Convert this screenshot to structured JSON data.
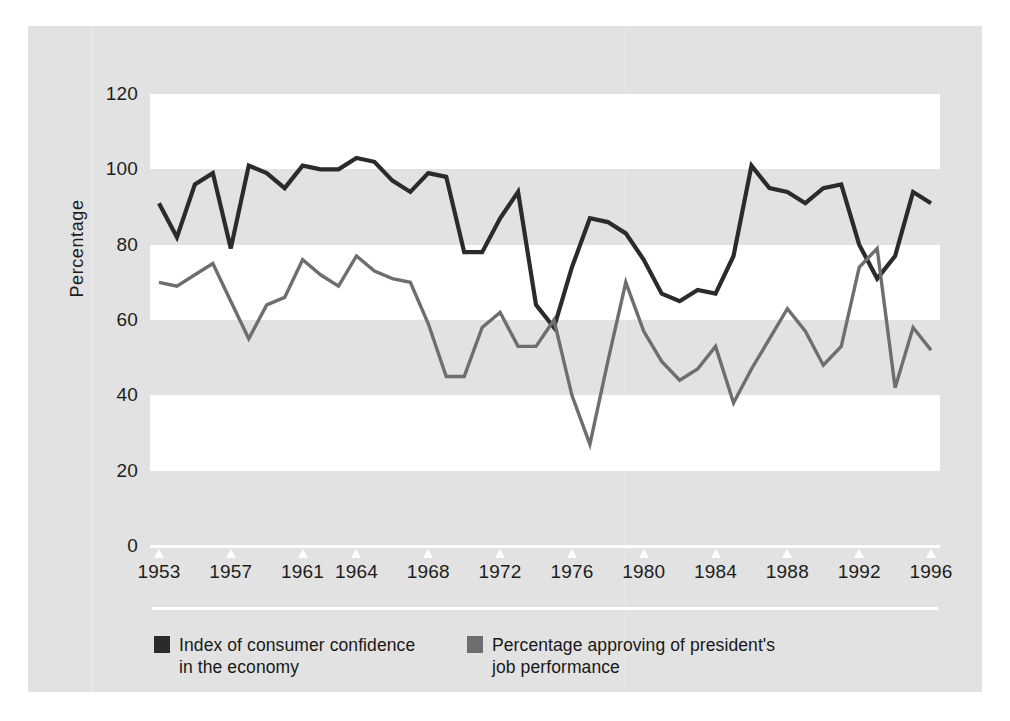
{
  "figure": {
    "background_color": "#e2e2e2",
    "plot_background_color": "#e2e2e2",
    "band_color": "#ffffff",
    "axis_color": "#ffffff",
    "text_color": "#1d1d1d"
  },
  "axes": {
    "ylabel": "Percentage",
    "yticks": [
      "0",
      "20",
      "40",
      "60",
      "80",
      "100",
      "120"
    ],
    "xticks": [
      "1953",
      "1957",
      "1961",
      "1964",
      "1968",
      "1972",
      "1976",
      "1980",
      "1984",
      "1988",
      "1992",
      "1996"
    ]
  },
  "legend": {
    "items": [
      {
        "label": "Index of consumer confidence\nin the economy",
        "color": "#2b2b2b",
        "swatch_name": "legend-swatch-consumer-confidence"
      },
      {
        "label": "Percentage approving of president's\njob performance",
        "color": "#6e6e6e",
        "swatch_name": "legend-swatch-approval"
      }
    ]
  },
  "chart_data": {
    "type": "line",
    "title": "",
    "xlabel": "",
    "ylabel": "Percentage",
    "ylim": [
      0,
      120
    ],
    "xlim": [
      1952.5,
      1996.5
    ],
    "grid": "horizontal-bands",
    "legend_position": "bottom-left",
    "tick_labels_x": [
      "1953",
      "1957",
      "1961",
      "1964",
      "1968",
      "1972",
      "1976",
      "1980",
      "1984",
      "1988",
      "1992",
      "1996"
    ],
    "tick_labels_y": [
      "0",
      "20",
      "40",
      "60",
      "80",
      "100",
      "120"
    ],
    "series": [
      {
        "name": "Index of consumer confidence in the economy",
        "color": "#2b2b2b",
        "x": [
          1953,
          1954,
          1955,
          1956,
          1957,
          1958,
          1959,
          1960,
          1961,
          1962,
          1963,
          1964,
          1965,
          1966,
          1967,
          1968,
          1969,
          1970,
          1971,
          1972,
          1973,
          1974,
          1975,
          1976,
          1977,
          1978,
          1979,
          1980,
          1981,
          1982,
          1983,
          1984,
          1985,
          1986,
          1987,
          1988,
          1989,
          1990,
          1991,
          1992,
          1993,
          1994,
          1995,
          1996
        ],
        "values": [
          91,
          82,
          96,
          99,
          79,
          101,
          99,
          95,
          101,
          100,
          100,
          103,
          102,
          97,
          94,
          99,
          98,
          78,
          78,
          87,
          94,
          64,
          58,
          74,
          87,
          86,
          83,
          76,
          67,
          65,
          68,
          67,
          77,
          101,
          95,
          94,
          91,
          95,
          96,
          80,
          71,
          77,
          94,
          91
        ]
      },
      {
        "name": "Percentage approving of president's job performance",
        "color": "#6e6e6e",
        "x": [
          1953,
          1954,
          1955,
          1956,
          1957,
          1958,
          1959,
          1960,
          1961,
          1962,
          1963,
          1964,
          1965,
          1966,
          1967,
          1968,
          1969,
          1970,
          1971,
          1972,
          1973,
          1974,
          1975,
          1976,
          1977,
          1978,
          1979,
          1980,
          1981,
          1982,
          1983,
          1984,
          1985,
          1986,
          1987,
          1988,
          1989,
          1990,
          1991,
          1992,
          1993,
          1994,
          1995,
          1996
        ],
        "values": [
          70,
          69,
          72,
          75,
          65,
          55,
          64,
          66,
          76,
          72,
          69,
          77,
          73,
          71,
          70,
          59,
          45,
          45,
          58,
          62,
          53,
          53,
          60,
          40,
          27,
          49,
          70,
          57,
          49,
          44,
          47,
          53,
          38,
          47,
          55,
          63,
          57,
          48,
          53,
          74,
          79,
          42,
          58,
          52
        ]
      }
    ]
  }
}
